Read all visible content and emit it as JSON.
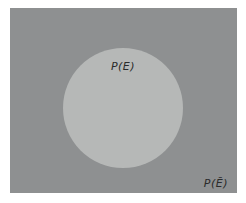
{
  "diagram": {
    "type": "venn-probability",
    "event_label": "P(E)",
    "complement_label": "P(Ē)",
    "colors": {
      "page_background": "#ffffff",
      "sample_space": "#8e9091",
      "event_circle": "#b6b8b7",
      "label_text": "#2b2b2b"
    }
  }
}
